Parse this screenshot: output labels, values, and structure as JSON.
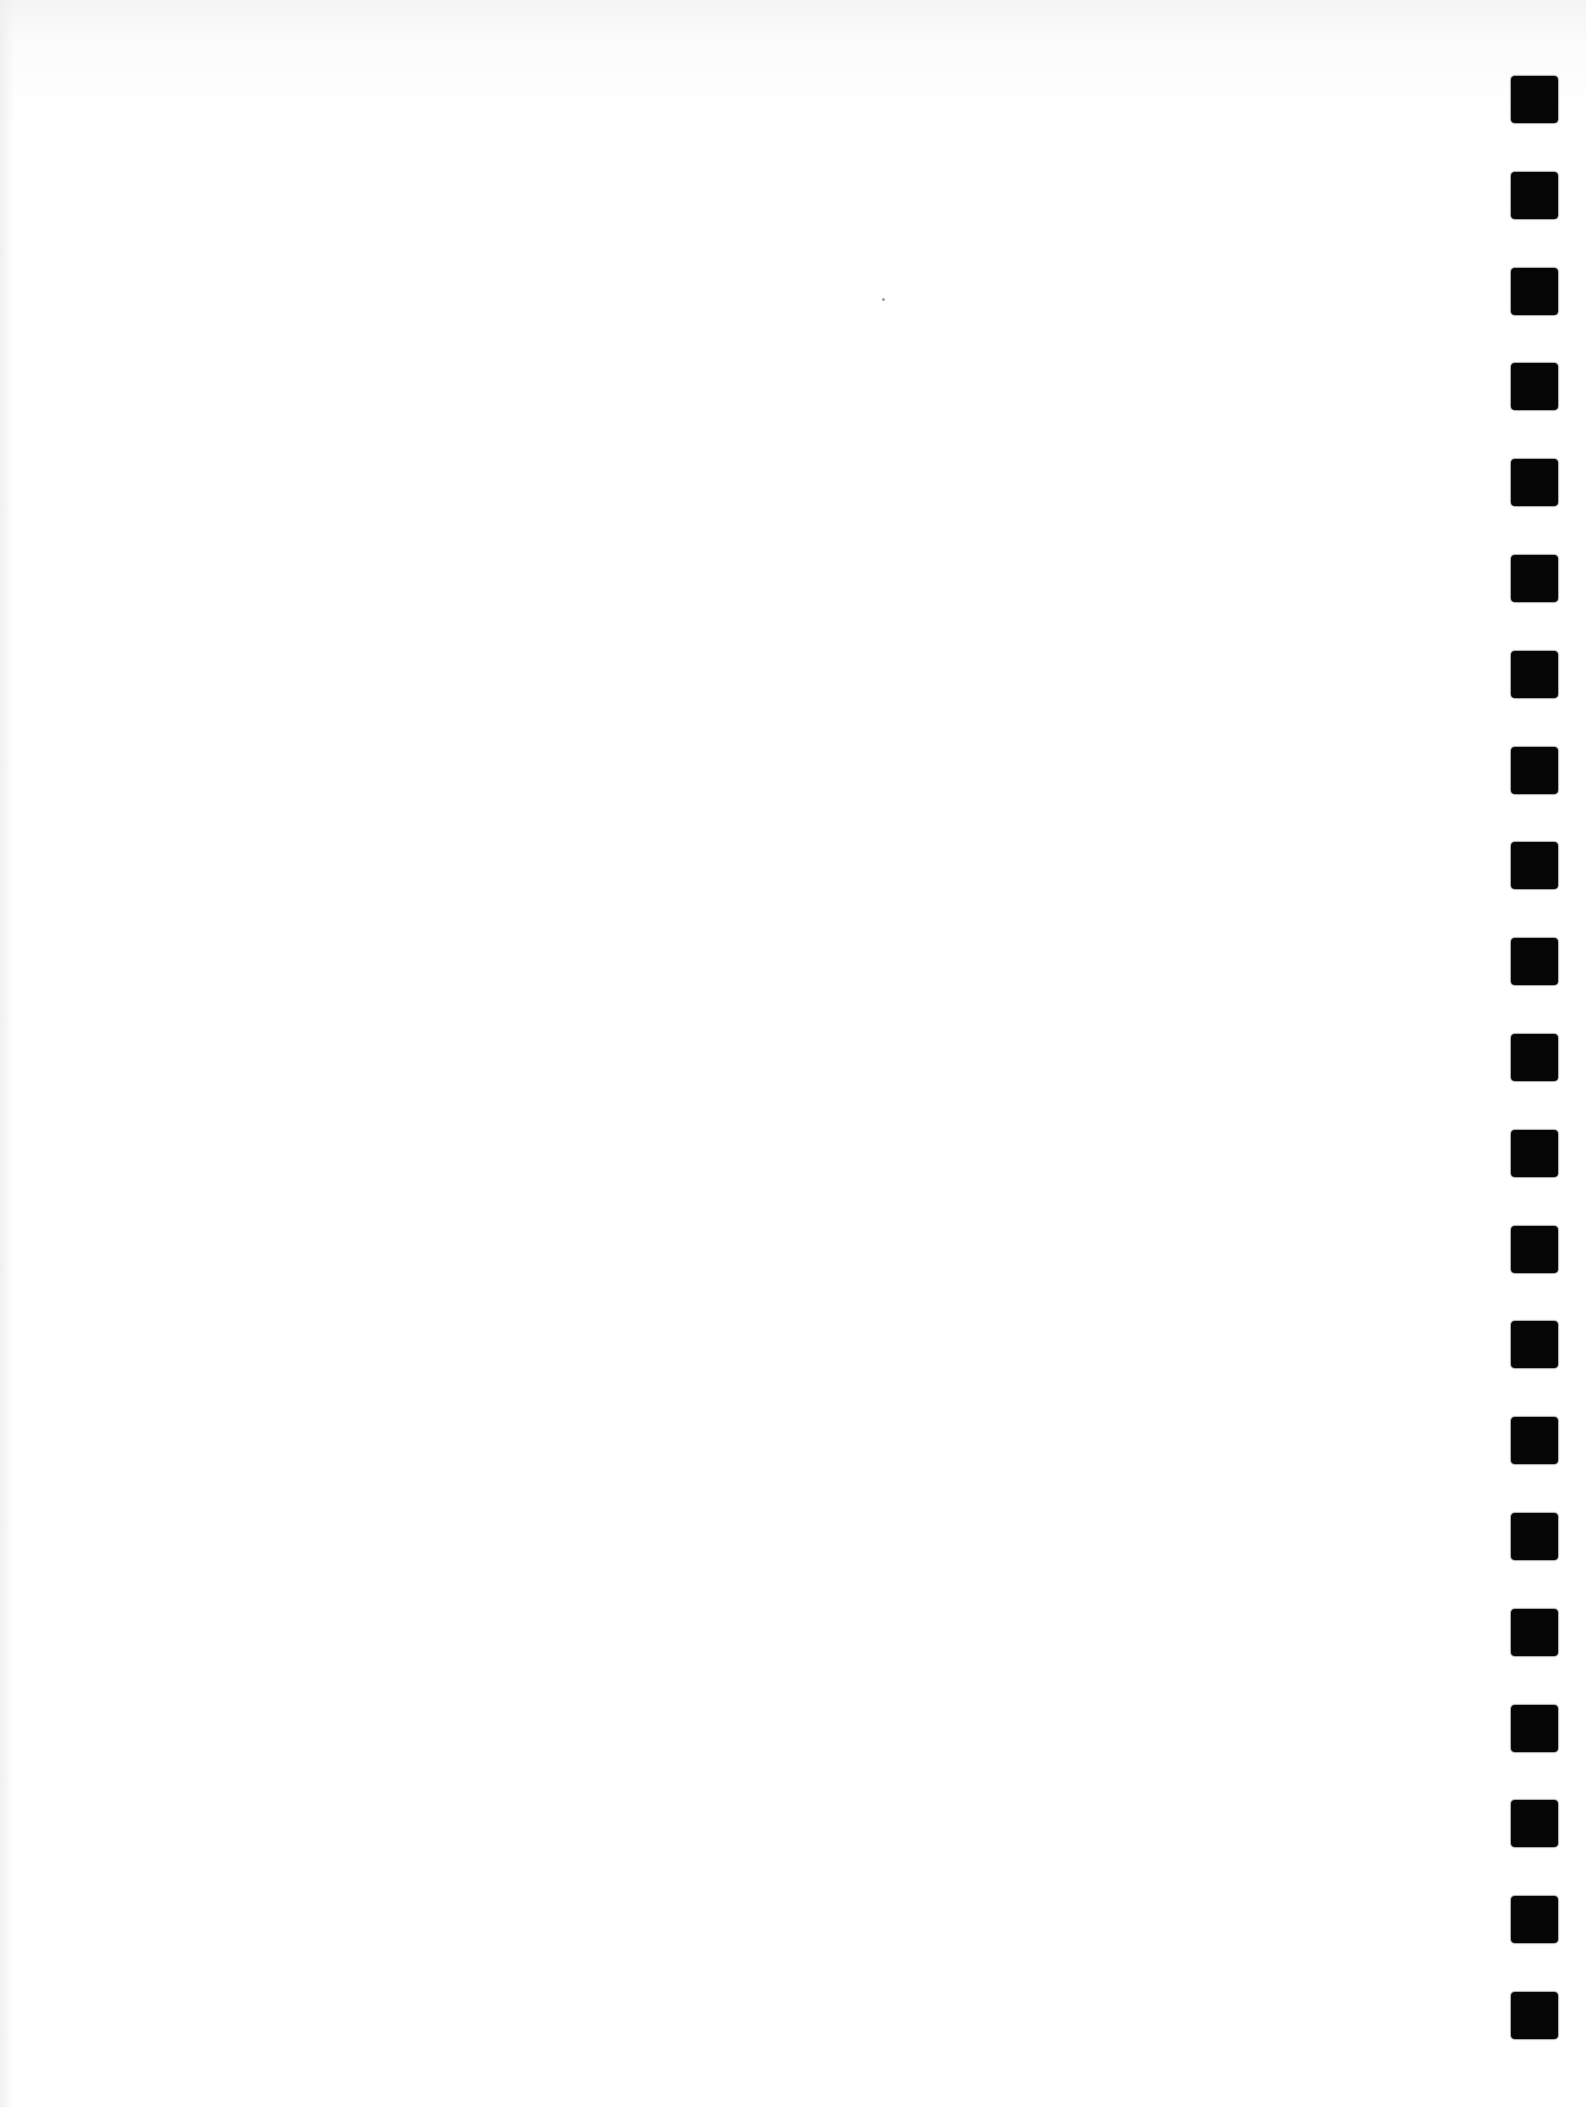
{
  "page": {
    "background": "#ffffff",
    "content_text": ""
  },
  "punch_holes": {
    "count": 21,
    "color": "#050505",
    "size_px": 47,
    "left_px": 1511,
    "first_top_px": 76,
    "spacing_px": 95.8
  }
}
